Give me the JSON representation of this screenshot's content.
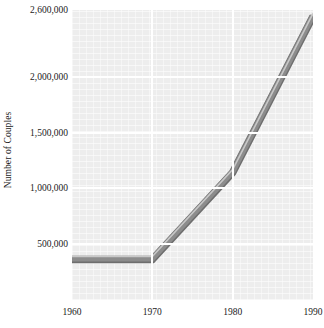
{
  "chart_data": {
    "type": "line",
    "title": "",
    "xlabel": "",
    "ylabel": "Number of Couples",
    "x": [
      1960,
      1970,
      1980,
      1990
    ],
    "series": [
      {
        "name": "Number of Couples",
        "values": [
          370000,
          370000,
          1150000,
          2550000
        ]
      }
    ],
    "xlim": [
      1960,
      1990
    ],
    "ylim": [
      0,
      2600000
    ],
    "xticks": [
      1960,
      1970,
      1980,
      1990
    ],
    "xticklabels": [
      "1960",
      "1970",
      "1980",
      "1990"
    ],
    "yticks": [
      500000,
      1000000,
      1500000,
      2000000,
      2600000
    ],
    "yticklabels": [
      "500,000",
      "1,000,000",
      "1,500,000",
      "2,000,000",
      "2,600,000"
    ],
    "grid": true,
    "legend": "none",
    "colors": {
      "line": "#8c8c8c",
      "line_highlight": "#c8c8c8",
      "line_shadow": "#6e6e6e",
      "plot_background": "#ededed",
      "gridline": "#ffffff",
      "text": "#1a1a1a",
      "figure_background": "#ffffff"
    }
  },
  "axes": {
    "y_title": "Number of Couples",
    "y_ticks": [
      {
        "label": "2,600,000",
        "value": 2600000
      },
      {
        "label": "2,000,000",
        "value": 2000000
      },
      {
        "label": "1,500,000",
        "value": 1500000
      },
      {
        "label": "1,000,000",
        "value": 1000000
      },
      {
        "label": "500,000",
        "value": 500000
      }
    ],
    "x_ticks": [
      {
        "label": "1960",
        "value": 1960
      },
      {
        "label": "1970",
        "value": 1970
      },
      {
        "label": "1980",
        "value": 1980
      },
      {
        "label": "1990",
        "value": 1990
      }
    ]
  }
}
